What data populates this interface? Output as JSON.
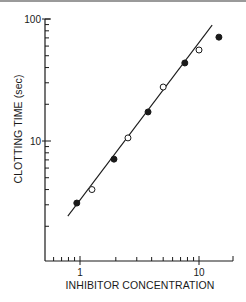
{
  "chart_data": {
    "type": "scatter",
    "title": "",
    "xlabel": "INHIBITOR CONCENTRATION",
    "ylabel": "CLOTTING TIME (sec)",
    "xscale": "log",
    "yscale": "log",
    "xlim": [
      0.51,
      19.3
    ],
    "ylim": [
      1.0,
      100
    ],
    "x_tick_labels": [
      {
        "value": 1,
        "label": "1"
      },
      {
        "value": 10,
        "label": "10"
      }
    ],
    "y_tick_labels": [
      {
        "value": 10,
        "label": "10"
      },
      {
        "value": 100,
        "label": "100"
      }
    ],
    "x_minor_ticks": [
      0.6,
      0.7,
      0.8,
      0.9,
      2,
      3,
      4,
      5,
      6,
      7,
      8,
      9
    ],
    "y_minor_ticks": [
      2,
      3,
      4,
      5,
      6,
      7,
      8,
      9,
      20,
      30,
      40,
      50,
      60,
      70,
      80,
      90
    ],
    "grid": false,
    "legend": null,
    "series": [
      {
        "name": "filled circles",
        "marker": "filled-circle",
        "points": [
          {
            "x": 0.94,
            "y": 3.1
          },
          {
            "x": 1.93,
            "y": 7.1
          },
          {
            "x": 3.73,
            "y": 17.3
          },
          {
            "x": 7.6,
            "y": 43.6
          },
          {
            "x": 14.7,
            "y": 71
          }
        ]
      },
      {
        "name": "open circles",
        "marker": "open-circle",
        "points": [
          {
            "x": 1.26,
            "y": 4.0
          },
          {
            "x": 2.53,
            "y": 10.6
          },
          {
            "x": 5.0,
            "y": 27.7
          },
          {
            "x": 10.0,
            "y": 55.7
          }
        ]
      }
    ],
    "fit_line": {
      "type": "linear-on-log-log",
      "start": {
        "x": 0.79,
        "y": 2.42
      },
      "end": {
        "x": 12.9,
        "y": 89
      }
    }
  }
}
